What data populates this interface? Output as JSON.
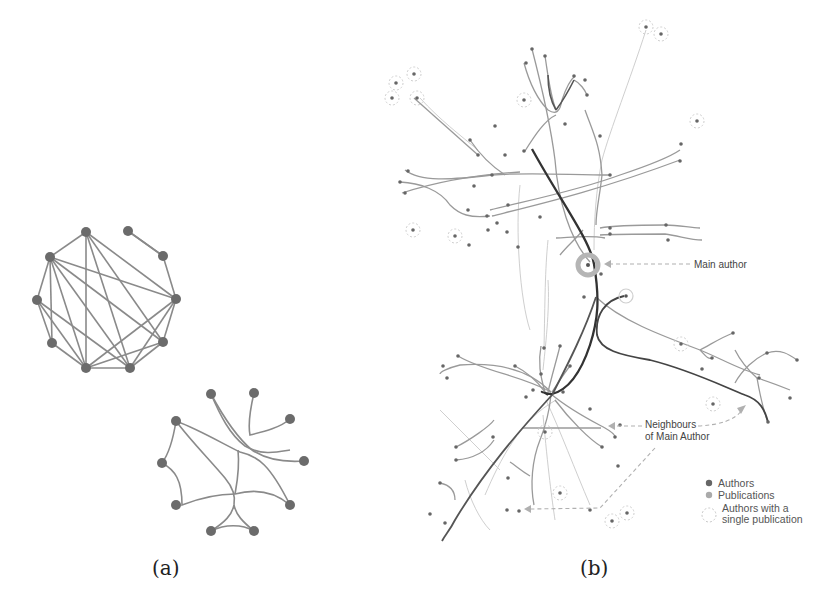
{
  "figure": {
    "panels": [
      {
        "id": "a",
        "caption": "(a)",
        "graphs": [
          {
            "name": "straight-edge-graph",
            "node_color": "#6b6b6b",
            "edge_color": "#8a8a8a",
            "nodes": [
              [
                86,
                232
              ],
              [
                128,
                231
              ],
              [
                163,
                256
              ],
              [
                176,
                299
              ],
              [
                163,
                342
              ],
              [
                130,
                368
              ],
              [
                86,
                368
              ],
              [
                52,
                343
              ],
              [
                37,
                300
              ],
              [
                50,
                257
              ]
            ],
            "edges": [
              [
                0,
                9
              ],
              [
                0,
                3
              ],
              [
                0,
                4
              ],
              [
                0,
                5
              ],
              [
                0,
                6
              ],
              [
                1,
                2
              ],
              [
                1,
                2
              ],
              [
                9,
                8
              ],
              [
                9,
                7
              ],
              [
                9,
                6
              ],
              [
                9,
                5
              ],
              [
                9,
                4
              ],
              [
                9,
                3
              ],
              [
                8,
                7
              ],
              [
                8,
                6
              ],
              [
                8,
                5
              ],
              [
                7,
                6
              ],
              [
                6,
                5
              ],
              [
                5,
                4
              ],
              [
                3,
                6
              ],
              [
                3,
                5
              ],
              [
                3,
                4
              ],
              [
                2,
                3
              ],
              [
                4,
                6
              ]
            ]
          },
          {
            "name": "bundled-edge-graph",
            "node_color": "#6b6b6b",
            "edge_color": "#8a8a8a",
            "nodes": [
              [
                211,
                394
              ],
              [
                254,
                393
              ],
              [
                290,
                419
              ],
              [
                304,
                461
              ],
              [
                290,
                505
              ],
              [
                254,
                531
              ],
              [
                211,
                531
              ],
              [
                176,
                505
              ],
              [
                162,
                463
              ],
              [
                176,
                421
              ]
            ]
          }
        ]
      },
      {
        "id": "b",
        "caption": "(b)",
        "annotations": {
          "main_author": "Main author",
          "neighbours_line1": "Neighbours",
          "neighbours_line2": "of Main Author"
        },
        "legend": {
          "items": [
            {
              "label": "Authors",
              "color": "#666666",
              "style": "filled"
            },
            {
              "label": "Publications",
              "color": "#aaaaaa",
              "style": "filled"
            },
            {
              "label_line1": "Authors with a",
              "label_line2": "single publication",
              "color": "#bbbbbb",
              "style": "dashed-ring"
            }
          ]
        }
      }
    ]
  }
}
